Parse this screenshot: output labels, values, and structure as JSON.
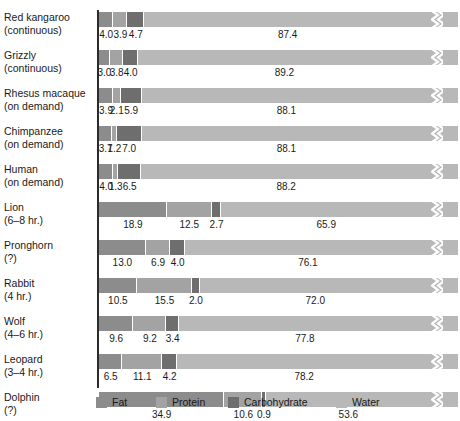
{
  "chart_data": {
    "type": "bar",
    "subtype": "stacked-horizontal-100pct",
    "title": "",
    "xlabel": "",
    "ylabel": "",
    "xlim": [
      0,
      100
    ],
    "grid": false,
    "legend_position": "bottom",
    "axis_break": true,
    "axis_break_note": "zig-zag break drawn near the right end of every bar",
    "value_unit": "percent",
    "categories": [
      "Red kangaroo",
      "Grizzly",
      "Rhesus macaque",
      "Chimpanzee",
      "Human",
      "Lion",
      "Pronghorn",
      "Rabbit",
      "Wolf",
      "Leopard",
      "Dolphin"
    ],
    "category_sublabels": [
      "(continuous)",
      "(continuous)",
      "(on demand)",
      "(on demand)",
      "(on demand)",
      "(6–8 hr.)",
      "(?)",
      "(4 hr.)",
      "(4–6 hr.)",
      "(3–4 hr.)",
      "(?)"
    ],
    "series": [
      {
        "name": "Fat",
        "color": "#8c8c8c",
        "values": [
          4.0,
          3.0,
          3.9,
          3.7,
          4.0,
          18.9,
          13.0,
          10.5,
          9.6,
          6.5,
          34.9
        ]
      },
      {
        "name": "Protein",
        "color": "#a3a3a3",
        "values": [
          3.9,
          3.8,
          2.1,
          1.2,
          1.3,
          12.5,
          6.9,
          15.5,
          9.2,
          11.1,
          10.6
        ]
      },
      {
        "name": "Carbohydrate",
        "color": "#6e6e6e",
        "values": [
          4.7,
          4.0,
          5.9,
          7.0,
          6.5,
          2.7,
          4.0,
          2.0,
          3.4,
          4.2,
          0.9
        ]
      },
      {
        "name": "Water",
        "color": "#b8b8b8",
        "values": [
          87.4,
          89.2,
          88.1,
          88.1,
          88.2,
          65.9,
          76.1,
          72.0,
          77.8,
          78.2,
          53.6
        ]
      }
    ]
  },
  "legend": {
    "items": [
      {
        "label": "Fat",
        "color": "#8c8c8c",
        "left": 96
      },
      {
        "label": "Protein",
        "color": "#a3a3a3",
        "left": 156
      },
      {
        "label": "Carbohydrate",
        "color": "#6e6e6e",
        "left": 228
      },
      {
        "label": "Water",
        "color": "#b8b8b8",
        "left": 336
      }
    ]
  }
}
